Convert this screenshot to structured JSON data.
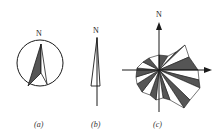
{
  "figures": [
    {
      "id": "a",
      "north_label": "N",
      "caption": "(a)",
      "description": "north arrow inside circle, half shaded"
    },
    {
      "id": "b",
      "north_label": "N",
      "caption": "(b)",
      "description": "slender north pointer on vertical line"
    },
    {
      "id": "c",
      "north_label": "N",
      "caption": "(c)",
      "description": "wind rose with alternating shaded sectors and axis arrows"
    }
  ],
  "colors": {
    "ink": "#1a1a1a",
    "shade": "#555555",
    "background": "#ffffff"
  }
}
